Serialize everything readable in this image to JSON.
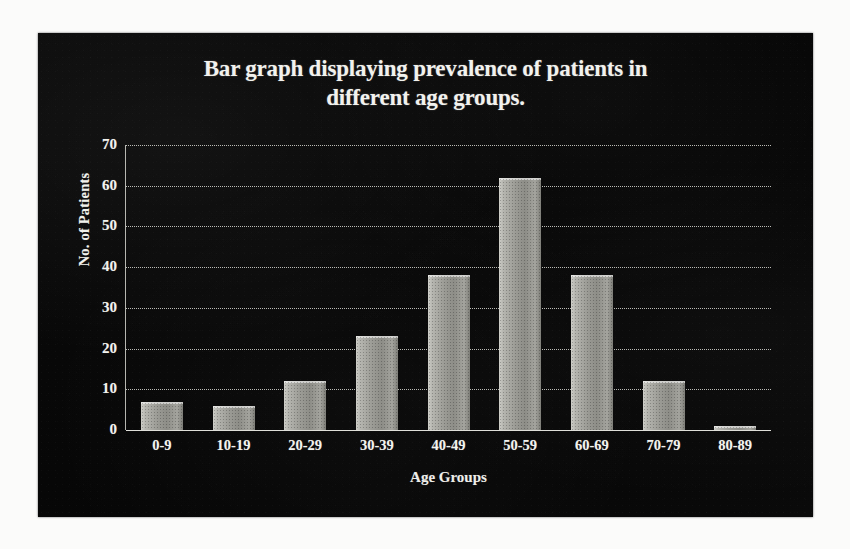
{
  "chart_data": {
    "type": "bar",
    "title": "Bar graph displaying prevalence of patients in different age groups.",
    "title_line1": "Bar graph displaying prevalence of patients in",
    "title_line2": "different age groups.",
    "xlabel": "Age Groups",
    "ylabel": "No. of Patients",
    "categories": [
      "0-9",
      "10-19",
      "20-29",
      "30-39",
      "40-49",
      "50-59",
      "60-69",
      "70-79",
      "80-89"
    ],
    "values": [
      7,
      6,
      12,
      23,
      38,
      62,
      38,
      12,
      1
    ],
    "ylim": [
      0,
      70
    ],
    "yticks": [
      70,
      60,
      50,
      40,
      30,
      20,
      10,
      0
    ],
    "grid": true,
    "legend": "none",
    "colors": {
      "background": "#070707",
      "page": "#fbfbfa",
      "bar": "#9c9c96",
      "bar_highlight": "#cfcfc9",
      "text": "#f2f2ee",
      "gridline": "#ecece6"
    }
  }
}
